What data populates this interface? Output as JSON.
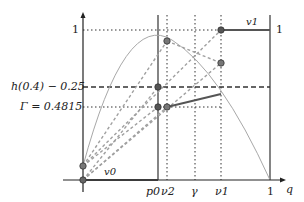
{
  "diagram": {
    "axes": {
      "x_label": "q",
      "y_tick_one": "1",
      "x_tick_one": "1"
    },
    "y_labels": {
      "one": "1",
      "h_level": "h(0.4) − 0.25",
      "gamma_level": "Γ = 0.4815"
    },
    "x_labels": {
      "p0": "p0",
      "nu2": "ν2",
      "gamma": "γ",
      "nu1": "ν1",
      "one": "1"
    },
    "curve_labels": {
      "v0": "v0",
      "v1": "v1"
    },
    "right_tick": "1",
    "colors": {
      "axis": "#222222",
      "curve": "#a8a8a8",
      "dashed_gray": "#a0a0a0",
      "thick_segment": "#555555",
      "point_fill": "#666666",
      "point_stroke": "#333333"
    }
  }
}
